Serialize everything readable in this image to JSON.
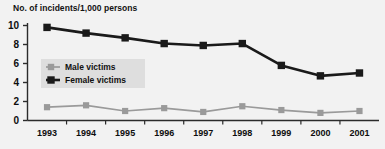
{
  "chart_data": {
    "type": "line",
    "title": "No. of incidents/1,000 persons",
    "xlabel": "",
    "ylabel": "",
    "categories": [
      "1993",
      "1994",
      "1995",
      "1996",
      "1997",
      "1998",
      "1999",
      "2000",
      "2001"
    ],
    "x": [
      1993,
      1994,
      1995,
      1996,
      1997,
      1998,
      1999,
      2000,
      2001
    ],
    "ylim": [
      0,
      10
    ],
    "yticks": [
      0,
      2,
      4,
      6,
      8,
      10
    ],
    "ytick_labels": [
      "0",
      "2",
      "4",
      "6",
      "8",
      "10"
    ],
    "grid": false,
    "legend_position": "inside-left",
    "series": [
      {
        "name": "Male victims",
        "color": "#9a9a9a",
        "marker": "square",
        "values": [
          1.4,
          1.6,
          1.0,
          1.3,
          0.9,
          1.5,
          1.1,
          0.8,
          1.0
        ]
      },
      {
        "name": "Female victims",
        "color": "#1a1a1a",
        "marker": "square",
        "values": [
          9.8,
          9.2,
          8.7,
          8.1,
          7.9,
          8.1,
          5.8,
          4.7,
          5.0
        ]
      }
    ]
  },
  "legend": {
    "entries": [
      {
        "label": "Male victims",
        "color": "#9a9a9a"
      },
      {
        "label": "Female victims",
        "color": "#1a1a1a"
      }
    ]
  },
  "colors": {
    "background": "#f2f2f2",
    "axis": "#2b2b2b",
    "male": "#9a9a9a",
    "female": "#1a1a1a",
    "legend_background": "#dedede"
  }
}
